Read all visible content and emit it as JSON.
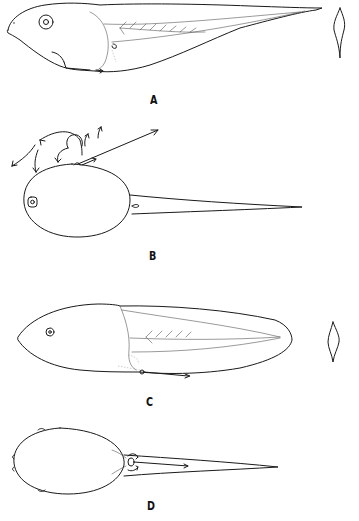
{
  "figure": {
    "panels": [
      {
        "id": "A",
        "label": "A",
        "description": "Tadpole, lateral view, with cross-section of tail"
      },
      {
        "id": "B",
        "label": "B",
        "description": "Tadpole, dorsal view, with arrows showing water currents"
      },
      {
        "id": "C",
        "label": "C",
        "description": "Tadpole, lateral view with broad tail fin, with cross-section of tail"
      },
      {
        "id": "D",
        "label": "D",
        "description": "Tadpole, ventral view with spiracle flow arrows"
      }
    ]
  }
}
